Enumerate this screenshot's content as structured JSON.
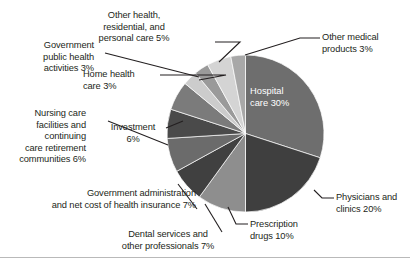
{
  "chart_data": {
    "type": "pie",
    "title": "",
    "subtitle": "",
    "xlabel": "",
    "ylabel": "",
    "units": "percent",
    "legend_position": "none",
    "grid": false,
    "label_style": "callout-leader-lines",
    "start_angle_deg": 0,
    "direction": "clockwise",
    "categories": [
      "Hospital care",
      "Physicians and clinics",
      "Prescription drugs",
      "Dental services and other professionals",
      "Government administration and net cost of health insurance",
      "Nursing care facilities and continuing care retirement communities",
      "Investment",
      "Home health care",
      "Government public health activities",
      "Other health, residential, and personal care",
      "Other medical products"
    ],
    "values": [
      30,
      20,
      10,
      7,
      7,
      6,
      6,
      3,
      3,
      5,
      3
    ],
    "colors": [
      "#6e6e6e",
      "#3f3f3f",
      "#8e8e8e",
      "#404040",
      "#6b6b6b",
      "#4a4a4a",
      "#7b7b7b",
      "#cccccc",
      "#9a9a9a",
      "#d4d4d4",
      "#a8a8a8"
    ],
    "slices": [
      {
        "label": "Hospital care 30%",
        "name": "Hospital care",
        "value": 30,
        "color": "#6e6e6e",
        "label_placement": "inside"
      },
      {
        "label": "Physicians and\nclinics 20%",
        "name": "Physicians and clinics",
        "value": 20,
        "color": "#3f3f3f",
        "label_placement": "outside-right"
      },
      {
        "label": "Prescription\ndrugs 10%",
        "name": "Prescription drugs",
        "value": 10,
        "color": "#8e8e8e",
        "label_placement": "outside-bottom"
      },
      {
        "label": "Dental services and\nother professionals 7%",
        "name": "Dental services and other professionals",
        "value": 7,
        "color": "#404040",
        "label_placement": "outside-bottom"
      },
      {
        "label": "Government administration\nand net cost of health insurance 7%",
        "name": "Government administration and net cost of health insurance",
        "value": 7,
        "color": "#6b6b6b",
        "label_placement": "outside-left"
      },
      {
        "label": "Nursing care\nfacilities and\ncontinuing\ncare retirement\ncommunities 6%",
        "name": "Nursing care facilities and continuing care retirement communities",
        "value": 6,
        "color": "#4a4a4a",
        "label_placement": "outside-left"
      },
      {
        "label": "Investment\n6%",
        "name": "Investment",
        "value": 6,
        "color": "#7b7b7b",
        "label_placement": "outside-left"
      },
      {
        "label": "Home health\ncare 3%",
        "name": "Home health care",
        "value": 3,
        "color": "#cccccc",
        "label_placement": "outside-left"
      },
      {
        "label": "Government\npublic health\nactivities 3%",
        "name": "Government public health activities",
        "value": 3,
        "color": "#9a9a9a",
        "label_placement": "outside-left"
      },
      {
        "label": "Other health,\nresidential, and\npersonal care 5%",
        "name": "Other health, residential, and personal care",
        "value": 5,
        "color": "#d4d4d4",
        "label_placement": "outside-top"
      },
      {
        "label": "Other medical\nproducts 3%",
        "name": "Other medical products",
        "value": 3,
        "color": "#a8a8a8",
        "label_placement": "outside-right"
      }
    ]
  },
  "labels": {
    "hospital_care": "Hospital\ncare 30%",
    "other_medical_products": "Other medical\nproducts 3%",
    "physicians_clinics": "Physicians and\nclinics 20%",
    "prescription_drugs": "Prescription\ndrugs 10%",
    "dental_services": "Dental services and\nother professionals 7%",
    "government_administration": "Government administration\nand net cost of health insurance 7%",
    "nursing_care": "Nursing care\nfacilities and\ncontinuing\ncare retirement\ncommunities 6%",
    "investment": "Investment\n6%",
    "government_public_health": "Government\npublic health\nactivities 3%",
    "home_health_care": "Home health\ncare 3%",
    "other_health_residential": "Other health,\nresidential, and\npersonal care 5%"
  },
  "theme": {
    "background": "#ffffff",
    "text_color": "#231f20",
    "inside_label_color": "#ffffff",
    "leader_line_color": "#231f20",
    "rule_color": "#b9b9b9"
  }
}
